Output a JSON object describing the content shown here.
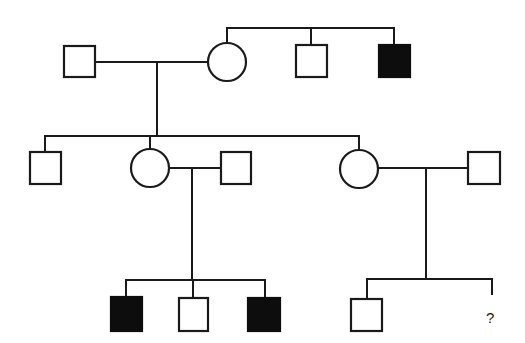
{
  "diagram": {
    "type": "pedigree",
    "colors": {
      "line": "#1a1a1a",
      "affected_fill": "#0d0d0d",
      "unaffected_fill": "#ffffff",
      "background": "#ffffff"
    },
    "generations": [
      {
        "id": "I",
        "individuals": [
          {
            "id": "I-1",
            "sex": "male",
            "affected": false
          },
          {
            "id": "I-2",
            "sex": "female",
            "affected": false
          },
          {
            "id": "I-3",
            "sex": "male",
            "affected": false,
            "relation": "sibling of I-2"
          },
          {
            "id": "I-4",
            "sex": "male",
            "affected": true,
            "relation": "sibling of I-2"
          }
        ]
      },
      {
        "id": "II",
        "individuals": [
          {
            "id": "II-1",
            "sex": "male",
            "affected": false
          },
          {
            "id": "II-2",
            "sex": "female",
            "affected": false
          },
          {
            "id": "II-3",
            "sex": "male",
            "affected": false,
            "relation": "spouse of II-2"
          },
          {
            "id": "II-4",
            "sex": "female",
            "affected": false
          },
          {
            "id": "II-5",
            "sex": "male",
            "affected": false,
            "relation": "spouse of II-4"
          }
        ]
      },
      {
        "id": "III",
        "individuals": [
          {
            "id": "III-1",
            "sex": "male",
            "affected": true
          },
          {
            "id": "III-2",
            "sex": "male",
            "affected": false
          },
          {
            "id": "III-3",
            "sex": "male",
            "affected": true
          },
          {
            "id": "III-4",
            "sex": "male",
            "affected": false
          },
          {
            "id": "III-5",
            "sex": "unknown",
            "affected": null,
            "label": "?"
          }
        ]
      }
    ],
    "unknown_label": "?"
  }
}
